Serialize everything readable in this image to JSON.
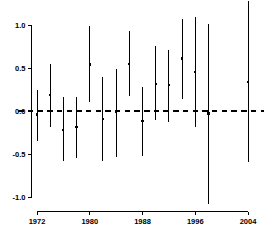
{
  "chart_data": {
    "type": "scatter",
    "title": "",
    "subtitle": "",
    "xlabel": "",
    "ylabel": "",
    "xlim": [
      1970.4,
      2005.6
    ],
    "ylim": [
      -1.17,
      1.28
    ],
    "grid": false,
    "legend": null,
    "reference_line": {
      "y": 0.0,
      "style": "dashed",
      "color": "#000000"
    },
    "y_ticks": [
      {
        "value": 1.0,
        "label": "1.0"
      },
      {
        "value": 0.5,
        "label": "0.5"
      },
      {
        "value": 0.0,
        "label": "0.0"
      },
      {
        "value": -0.5,
        "label": "-0.5"
      },
      {
        "value": -1.0,
        "label": "-1.0"
      }
    ],
    "x_ticks": [
      {
        "value": 1972,
        "label": "1972"
      },
      {
        "value": 1980,
        "label": "1980"
      },
      {
        "value": 1988,
        "label": "1988"
      },
      {
        "value": 1996,
        "label": "1996"
      },
      {
        "value": 2004,
        "label": "2004"
      }
    ],
    "x_axis_range_drawn": [
      1972,
      2004
    ],
    "y_axis_range_drawn": [
      -1.0,
      1.0
    ],
    "marker": "point",
    "errorbar_style": "vertical-line",
    "x": [
      1972,
      1974,
      1976,
      1978,
      1980,
      1982,
      1984,
      1986,
      1988,
      1990,
      1992,
      1994,
      1996,
      1998,
      2000,
      2004
    ],
    "values": [
      -0.04,
      0.19,
      -0.22,
      -0.19,
      0.54,
      -0.09,
      -0.01,
      0.55,
      -0.12,
      0.31,
      0.3,
      0.61,
      0.45,
      -0.03,
      null,
      0.34
    ],
    "lower": [
      -0.35,
      -0.19,
      -0.58,
      -0.55,
      0.1,
      -0.58,
      -0.53,
      0.17,
      -0.52,
      -0.11,
      -0.13,
      0.14,
      -0.19,
      -1.08,
      null,
      -0.59
    ],
    "upper": [
      0.25,
      0.55,
      0.16,
      0.16,
      0.99,
      0.4,
      0.49,
      0.93,
      0.28,
      0.76,
      0.71,
      1.07,
      1.09,
      1.01,
      null,
      1.28
    ],
    "series": [
      {
        "name": "estimate-with-interval",
        "points": [
          {
            "x": 1972,
            "y": -0.04,
            "lo": -0.35,
            "hi": 0.25
          },
          {
            "x": 1974,
            "y": 0.19,
            "lo": -0.19,
            "hi": 0.55
          },
          {
            "x": 1976,
            "y": -0.22,
            "lo": -0.58,
            "hi": 0.16
          },
          {
            "x": 1978,
            "y": -0.19,
            "lo": -0.55,
            "hi": 0.16
          },
          {
            "x": 1980,
            "y": 0.54,
            "lo": 0.1,
            "hi": 0.99
          },
          {
            "x": 1982,
            "y": -0.09,
            "lo": -0.58,
            "hi": 0.4
          },
          {
            "x": 1984,
            "y": -0.01,
            "lo": -0.53,
            "hi": 0.49
          },
          {
            "x": 1986,
            "y": 0.55,
            "lo": 0.17,
            "hi": 0.93
          },
          {
            "x": 1988,
            "y": -0.12,
            "lo": -0.52,
            "hi": 0.28
          },
          {
            "x": 1990,
            "y": 0.31,
            "lo": -0.11,
            "hi": 0.76
          },
          {
            "x": 1992,
            "y": 0.3,
            "lo": -0.13,
            "hi": 0.71
          },
          {
            "x": 1994,
            "y": 0.61,
            "lo": 0.14,
            "hi": 1.07
          },
          {
            "x": 1996,
            "y": 0.45,
            "lo": -0.19,
            "hi": 1.09
          },
          {
            "x": 1998,
            "y": -0.03,
            "lo": -1.08,
            "hi": 1.01
          },
          {
            "x": 2004,
            "y": 0.34,
            "lo": -0.59,
            "hi": 1.28
          }
        ]
      }
    ],
    "colors": {
      "line": "#000000",
      "marker": "#000000",
      "axis": "#000000",
      "background": "#ffffff"
    }
  }
}
